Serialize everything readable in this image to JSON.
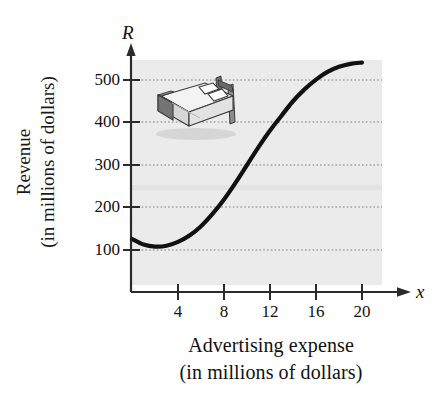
{
  "figure": {
    "name": "revenue-vs-advertising-expense-graph",
    "background_color": "#ffffff",
    "plot_fill_color": "#ebebeb",
    "curve_color": "#111111",
    "axis_color": "#2b2b2b",
    "grid_color": "#8a8a8a"
  },
  "axes": {
    "y_axis_symbol": "R",
    "x_axis_symbol": "x",
    "ylabel_line1": "Revenue",
    "ylabel_line2": "(in millions of dollars)",
    "xlabel_line1": "Advertising expense",
    "xlabel_line2": "(in millions of dollars)"
  },
  "ticks": {
    "x": [
      {
        "value": 4,
        "label": "4"
      },
      {
        "value": 8,
        "label": "8"
      },
      {
        "value": 12,
        "label": "12"
      },
      {
        "value": 16,
        "label": "16"
      },
      {
        "value": 20,
        "label": "20"
      }
    ],
    "y": [
      {
        "value": 100,
        "label": "100"
      },
      {
        "value": 200,
        "label": "200"
      },
      {
        "value": 300,
        "label": "300"
      },
      {
        "value": 400,
        "label": "400"
      },
      {
        "value": 500,
        "label": "500"
      }
    ]
  },
  "illustration": {
    "name": "bed-illustration",
    "description": "3D line drawing of a double bed with headboard and two pillows",
    "colors": {
      "frame_dark": "#6f6f6f",
      "mattress_light": "#f2f2f2",
      "mattress_side": "#cfcfcf",
      "pillow": "#fbfbfb",
      "outline": "#3a3a3a",
      "shadow": "#c8c8c8"
    }
  },
  "chart_data": {
    "type": "line",
    "title": "",
    "xlabel": "Advertising expense (in millions of dollars)",
    "ylabel": "Revenue (in millions of dollars)",
    "xlim": [
      0,
      21
    ],
    "ylim": [
      0,
      560
    ],
    "grid": true,
    "grid_axis": "y",
    "legend": "none",
    "xticks": [
      4,
      8,
      12,
      16,
      20
    ],
    "yticks": [
      100,
      200,
      300,
      400,
      500
    ],
    "series": [
      {
        "name": "Revenue R(x)",
        "x": [
          0,
          1,
          2,
          3,
          4,
          5,
          6,
          7,
          8,
          9,
          10,
          11,
          12,
          13,
          14,
          15,
          16,
          17,
          18,
          19,
          20
        ],
        "y": [
          126,
          113,
          108,
          110,
          119,
          134,
          156,
          185,
          219,
          258,
          300,
          342,
          381,
          416,
          450,
          478,
          501,
          519,
          531,
          538,
          541
        ]
      }
    ],
    "annotations": [
      {
        "text": "local minimum near x = 2, R ≈ 108"
      },
      {
        "text": "S-shaped growth with inflection near x = 10, R ≈ 300"
      },
      {
        "text": "levels off near R ≈ 540 at x = 20"
      }
    ]
  }
}
